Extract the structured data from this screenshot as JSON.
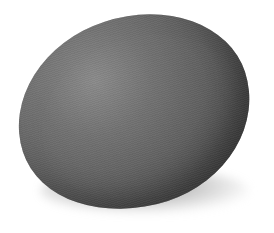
{
  "image": {
    "subject": "egg",
    "description": "A single dark gray egg lying on its side on a white background with a soft shadow beneath it",
    "colors": {
      "background": "#ffffff",
      "egg_highlight": "#8a8a8a",
      "egg_midtone": "#666666",
      "egg_shadow": "#3c3c3c",
      "ground_shadow": "#5a5a5a"
    }
  }
}
